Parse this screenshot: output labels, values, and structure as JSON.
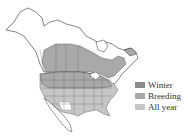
{
  "map": {
    "type": "species-range-map",
    "region": "North America",
    "colors": {
      "land": "#ffffff",
      "border": "#333333",
      "range_primary": "#a9a9a9",
      "range_allyear": "#c6c6c6",
      "range_winter": "#8a8a8a"
    }
  },
  "legend": {
    "items": [
      {
        "label": "Winter",
        "color": "#8a8a8a"
      },
      {
        "label": "Breeding",
        "color": "#a9a9a9"
      },
      {
        "label": "All year",
        "color": "#c6c6c6"
      }
    ]
  }
}
